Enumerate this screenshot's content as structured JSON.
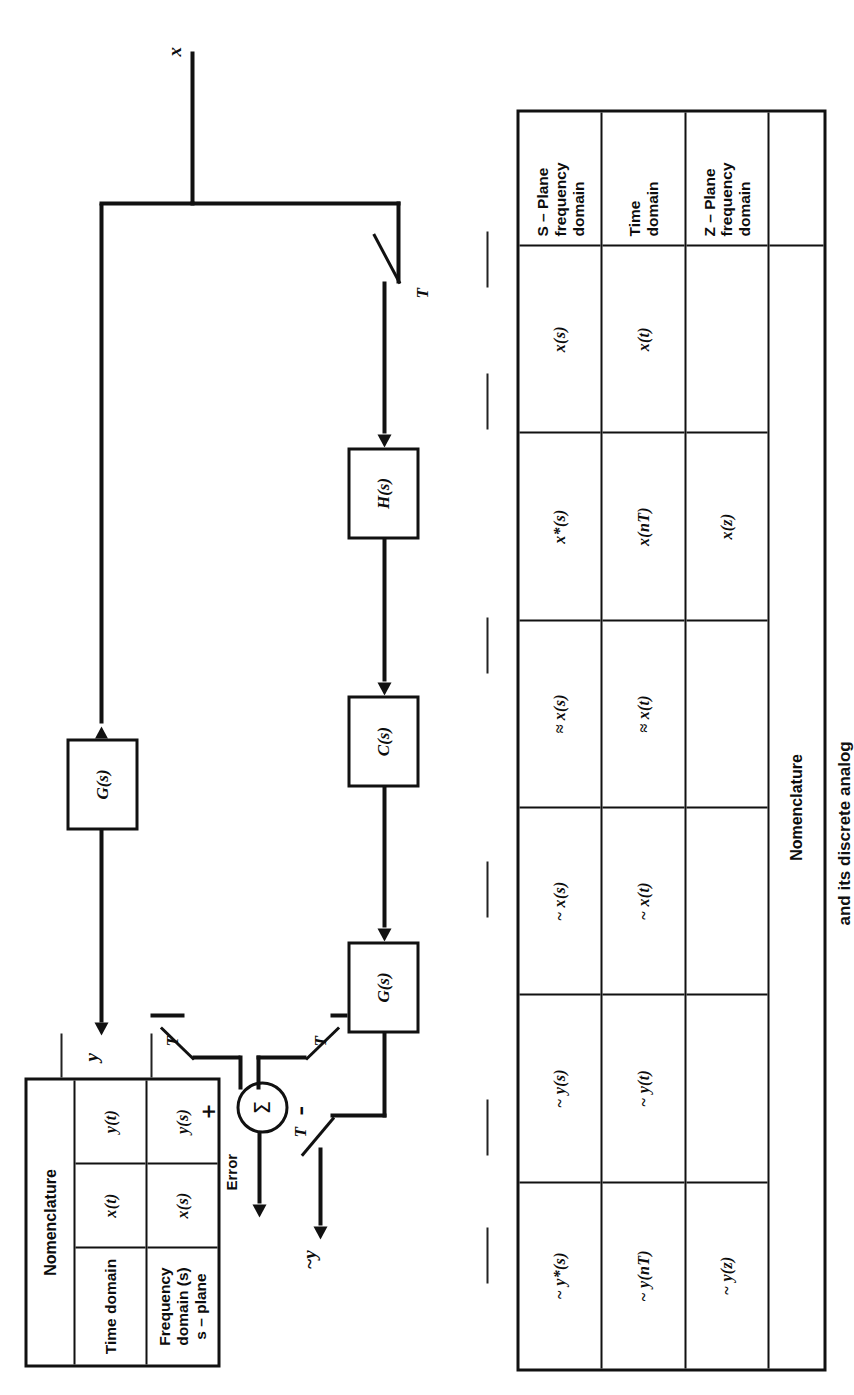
{
  "figure": {
    "caption": "and its discrete analog",
    "input_signal": "x",
    "output_signal_analog": "y",
    "output_signal_discrete": "~y",
    "error_label": "Error",
    "sum_symbol": "Σ",
    "plus_sign": "+",
    "minus_sign": "–",
    "sampler_label": "T"
  },
  "blocks": {
    "analog_forward": "G(s)",
    "digital_hold": "H(s)",
    "digital_controller": "C(s)",
    "digital_plant": "G(s)"
  },
  "top_table": {
    "title": "Nomenclature",
    "row_labels": [
      "",
      "Time domain",
      "Frequency domain (s)\ns – plane"
    ],
    "columns": [
      {
        "cells": [
          "",
          "x(t)",
          "x(s)"
        ]
      },
      {
        "cells": [
          "",
          "y(t)",
          "y(s)"
        ]
      }
    ],
    "flat_values": {
      "x_time": "x(t)",
      "x_freq": "x(s)",
      "y_time": "y(t)",
      "y_freq": "y(s)"
    }
  },
  "bottom_table": {
    "title": "Nomenclature",
    "row_labels": [
      "S – Plane\nfrequency\ndomain",
      "Time\ndomain",
      "Z – Plane\nfrequency\ndomain",
      ""
    ],
    "columns": [
      {
        "cells": [
          "x(s)",
          "x(t)",
          "",
          ""
        ]
      },
      {
        "cells": [
          "x*(s)",
          "x(nT)",
          "x(z)",
          ""
        ]
      },
      {
        "cells": [
          "≈ x(s)",
          "≈ x(t)",
          "",
          ""
        ]
      },
      {
        "cells": [
          "~ x(s)",
          "~ x(t)",
          "",
          ""
        ]
      },
      {
        "cells": [
          "~ y(s)",
          "~ y(t)",
          "",
          ""
        ]
      },
      {
        "cells": [
          "~ y*(s)",
          "~ y(nT)",
          "~ y(z)",
          ""
        ]
      }
    ]
  },
  "icons": {
    "arrow": "arrow-icon",
    "summing_junction": "summing-junction-icon",
    "sampler_switch": "sampler-switch-icon"
  },
  "colors": {
    "ink": "#111111",
    "paper": "#ffffff"
  }
}
